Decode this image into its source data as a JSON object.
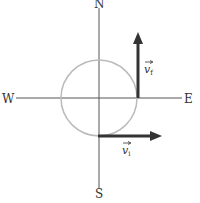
{
  "diagram": {
    "compass": {
      "north": "N",
      "south": "S",
      "east": "E",
      "west": "W"
    },
    "vectors": {
      "initial": {
        "symbol": "v",
        "subscript": "i",
        "direction": "east"
      },
      "final": {
        "symbol": "v",
        "subscript": "f",
        "direction": "north"
      }
    },
    "colors": {
      "axis": "#555555",
      "circle": "#bbbbbb",
      "vector": "#333333"
    }
  }
}
